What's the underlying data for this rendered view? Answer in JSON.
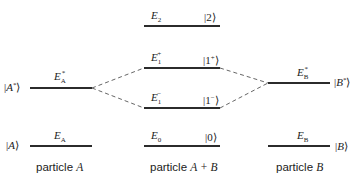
{
  "diagram": {
    "columns": [
      {
        "id": "particle-a",
        "caption_prefix": "particle ",
        "caption_var": "A"
      },
      {
        "id": "particle-ab",
        "caption_prefix": "particle ",
        "caption_var": "A + B"
      },
      {
        "id": "particle-b",
        "caption_prefix": "particle ",
        "caption_var": "B"
      }
    ],
    "levels": {
      "a_excited": {
        "energy_sym": "E",
        "energy_sub": "A",
        "energy_sup": "*",
        "state_open": "|",
        "state_var": "A",
        "state_sup": "*",
        "state_close": "⟩"
      },
      "a_ground": {
        "energy_sym": "E",
        "energy_sub": "A",
        "state_open": "|",
        "state_var": "A",
        "state_close": "⟩"
      },
      "e2": {
        "energy_sym": "E",
        "energy_sub": "2",
        "state": "|2⟩"
      },
      "e1_plus": {
        "energy_sym": "E",
        "energy_sub": "1",
        "energy_sup": "+",
        "state_open": "|1",
        "state_sup": "+",
        "state_close": "⟩"
      },
      "e1_minus": {
        "energy_sym": "E",
        "energy_sub": "1",
        "energy_sup": "−",
        "state_open": "|1",
        "state_sup": "−",
        "state_close": "⟩"
      },
      "e0": {
        "energy_sym": "E",
        "energy_sub": "0",
        "state": "|0⟩"
      },
      "b_excited": {
        "energy_sym": "E",
        "energy_sub": "B",
        "energy_sup": "*",
        "state_open": "|",
        "state_var": "B",
        "state_sup": "*",
        "state_close": "⟩"
      },
      "b_ground": {
        "energy_sym": "E",
        "energy_sub": "B",
        "state_open": "|",
        "state_var": "B",
        "state_close": "⟩"
      }
    },
    "colors": {
      "line": "#2b2b2b",
      "dash": "#555555",
      "text": "#222222",
      "background": "#ffffff"
    }
  }
}
